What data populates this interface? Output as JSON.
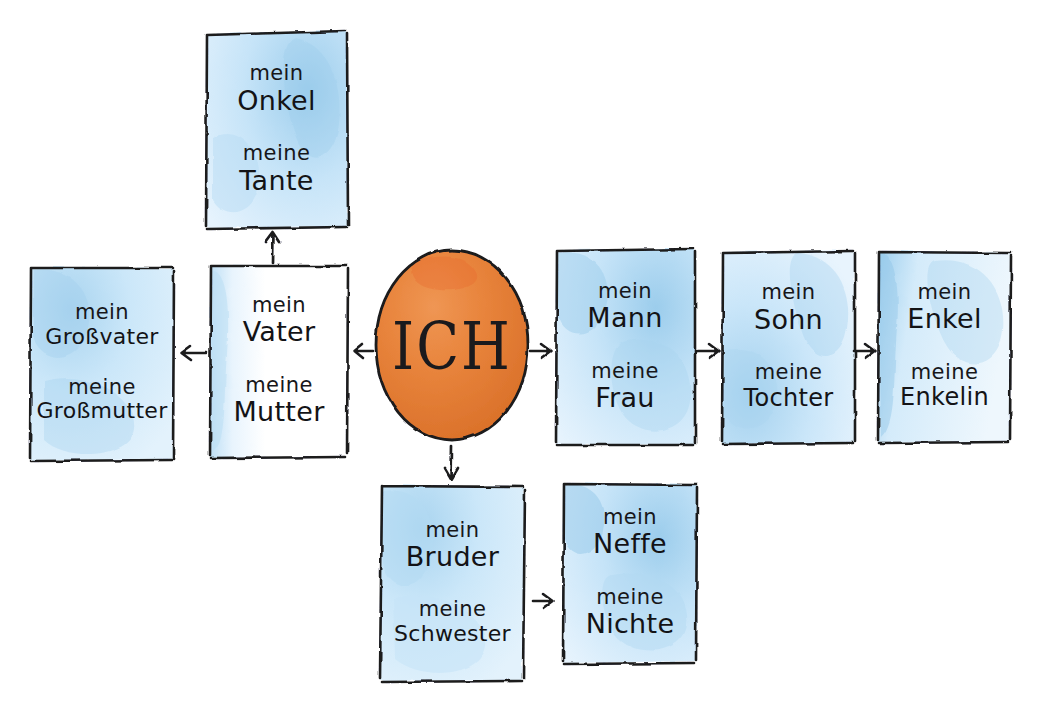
{
  "diagram": {
    "center": {
      "label": "ICH",
      "shape": "circle",
      "color": "#e8843c"
    },
    "palette": {
      "box_fill_light": "#dceffb",
      "box_fill_mid": "#bcdff4",
      "box_fill_deep": "#8fc5e8",
      "ink": "#1a1a1d",
      "center_fill": "#e8843c",
      "center_fill_deep": "#e06a2a",
      "background": "#ffffff"
    },
    "nodes": [
      {
        "id": "onkel-tante",
        "masculine_article": "mein",
        "masculine": "Onkel",
        "feminine_article": "meine",
        "feminine": "Tante",
        "fill": "blue"
      },
      {
        "id": "grosseltern",
        "masculine_article": "mein",
        "masculine": "Großvater",
        "feminine_article": "meine",
        "feminine": "Großmutter",
        "fill": "blue"
      },
      {
        "id": "eltern",
        "masculine_article": "mein",
        "masculine": "Vater",
        "feminine_article": "meine",
        "feminine": "Mutter",
        "fill": "white"
      },
      {
        "id": "partner",
        "masculine_article": "mein",
        "masculine": "Mann",
        "feminine_article": "meine",
        "feminine": "Frau",
        "fill": "blue"
      },
      {
        "id": "kinder",
        "masculine_article": "mein",
        "masculine": "Sohn",
        "feminine_article": "meine",
        "feminine": "Tochter",
        "fill": "blue"
      },
      {
        "id": "enkelkinder",
        "masculine_article": "mein",
        "masculine": "Enkel",
        "feminine_article": "meine",
        "feminine": "Enkelin",
        "fill": "blue"
      },
      {
        "id": "geschwister",
        "masculine_article": "mein",
        "masculine": "Bruder",
        "feminine_article": "meine",
        "feminine": "Schwester",
        "fill": "blue"
      },
      {
        "id": "neffe-nichte",
        "masculine_article": "mein",
        "masculine": "Neffe",
        "feminine_article": "meine",
        "feminine": "Nichte",
        "fill": "blue"
      }
    ],
    "arrows": [
      {
        "id": "eltern-to-onkel",
        "from": "eltern",
        "to": "onkel-tante",
        "direction": "up"
      },
      {
        "id": "eltern-to-grosseltern",
        "from": "eltern",
        "to": "grosseltern",
        "direction": "left"
      },
      {
        "id": "ich-to-eltern",
        "from": "ich",
        "to": "eltern",
        "direction": "left"
      },
      {
        "id": "ich-to-partner",
        "from": "ich",
        "to": "partner",
        "direction": "right"
      },
      {
        "id": "partner-to-kinder",
        "from": "partner",
        "to": "kinder",
        "direction": "right"
      },
      {
        "id": "kinder-to-enkelkinder",
        "from": "kinder",
        "to": "enkelkinder",
        "direction": "right"
      },
      {
        "id": "ich-to-geschwister",
        "from": "ich",
        "to": "geschwister",
        "direction": "down"
      },
      {
        "id": "geschwister-to-neffe",
        "from": "geschwister",
        "to": "neffe-nichte",
        "direction": "right"
      }
    ]
  }
}
